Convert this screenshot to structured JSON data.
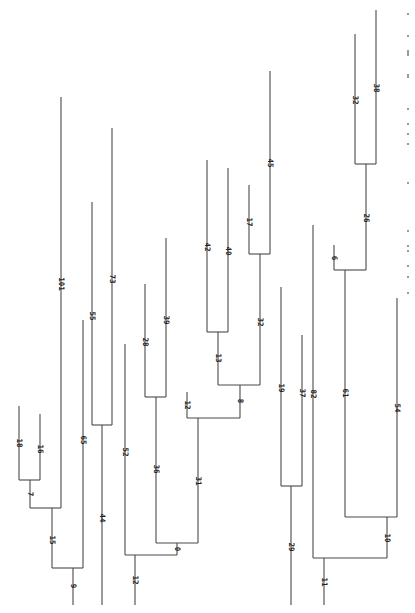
{
  "figure": {
    "type": "phylogenetic-tree",
    "orientation": "rotated-90",
    "line_color": "#4a4a4a",
    "label_color": "#222222",
    "background": "#ffffff"
  },
  "segments": [
    {
      "id": "b18",
      "x1": 19,
      "y1": 406,
      "x2": 19,
      "y2": 480
    },
    {
      "id": "b16",
      "x1": 40,
      "y1": 414,
      "x2": 40,
      "y2": 480
    },
    {
      "id": "h18_16",
      "x1": 19,
      "y1": 480,
      "x2": 40,
      "y2": 480
    },
    {
      "id": "b7",
      "x1": 30,
      "y1": 480,
      "x2": 30,
      "y2": 508
    },
    {
      "id": "b101",
      "x1": 61,
      "y1": 97,
      "x2": 61,
      "y2": 508
    },
    {
      "id": "h7_101",
      "x1": 30,
      "y1": 508,
      "x2": 61,
      "y2": 508
    },
    {
      "id": "b15",
      "x1": 52,
      "y1": 508,
      "x2": 52,
      "y2": 568
    },
    {
      "id": "b65",
      "x1": 83,
      "y1": 320,
      "x2": 83,
      "y2": 568
    },
    {
      "id": "h15_65",
      "x1": 52,
      "y1": 568,
      "x2": 83,
      "y2": 568
    },
    {
      "id": "b9",
      "x1": 73,
      "y1": 568,
      "x2": 73,
      "y2": 605
    },
    {
      "id": "b55",
      "x1": 92,
      "y1": 202,
      "x2": 92,
      "y2": 425
    },
    {
      "id": "b73",
      "x1": 112,
      "y1": 128,
      "x2": 112,
      "y2": 425
    },
    {
      "id": "h55_73",
      "x1": 92,
      "y1": 425,
      "x2": 112,
      "y2": 425
    },
    {
      "id": "b44",
      "x1": 102,
      "y1": 425,
      "x2": 102,
      "y2": 605
    },
    {
      "id": "b52",
      "x1": 125,
      "y1": 344,
      "x2": 125,
      "y2": 555
    },
    {
      "id": "b28",
      "x1": 145,
      "y1": 284,
      "x2": 145,
      "y2": 397
    },
    {
      "id": "b39",
      "x1": 166,
      "y1": 238,
      "x2": 166,
      "y2": 397
    },
    {
      "id": "h28_39",
      "x1": 145,
      "y1": 397,
      "x2": 166,
      "y2": 397
    },
    {
      "id": "b36",
      "x1": 156,
      "y1": 397,
      "x2": 156,
      "y2": 543
    },
    {
      "id": "b12a",
      "x1": 187,
      "y1": 392,
      "x2": 187,
      "y2": 418
    },
    {
      "id": "b42",
      "x1": 207,
      "y1": 160,
      "x2": 207,
      "y2": 332
    },
    {
      "id": "b40",
      "x1": 228,
      "y1": 168,
      "x2": 228,
      "y2": 332
    },
    {
      "id": "h42_40",
      "x1": 207,
      "y1": 332,
      "x2": 228,
      "y2": 332
    },
    {
      "id": "b13",
      "x1": 218,
      "y1": 332,
      "x2": 218,
      "y2": 385
    },
    {
      "id": "b17",
      "x1": 249,
      "y1": 185,
      "x2": 249,
      "y2": 254
    },
    {
      "id": "b45",
      "x1": 270,
      "y1": 71,
      "x2": 270,
      "y2": 254
    },
    {
      "id": "h17_45",
      "x1": 249,
      "y1": 254,
      "x2": 270,
      "y2": 254
    },
    {
      "id": "b32a",
      "x1": 260,
      "y1": 254,
      "x2": 260,
      "y2": 385
    },
    {
      "id": "h13_32",
      "x1": 218,
      "y1": 385,
      "x2": 260,
      "y2": 385
    },
    {
      "id": "b8",
      "x1": 240,
      "y1": 385,
      "x2": 240,
      "y2": 418
    },
    {
      "id": "h12_8",
      "x1": 187,
      "y1": 418,
      "x2": 240,
      "y2": 418
    },
    {
      "id": "b31",
      "x1": 198,
      "y1": 418,
      "x2": 198,
      "y2": 543
    },
    {
      "id": "h36_31",
      "x1": 156,
      "y1": 543,
      "x2": 198,
      "y2": 543
    },
    {
      "id": "b0",
      "x1": 177,
      "y1": 543,
      "x2": 177,
      "y2": 555
    },
    {
      "id": "h52_0",
      "x1": 125,
      "y1": 555,
      "x2": 177,
      "y2": 555
    },
    {
      "id": "b12b",
      "x1": 135,
      "y1": 555,
      "x2": 135,
      "y2": 605
    },
    {
      "id": "b19",
      "x1": 281,
      "y1": 287,
      "x2": 281,
      "y2": 486
    },
    {
      "id": "b37",
      "x1": 302,
      "y1": 335,
      "x2": 302,
      "y2": 486
    },
    {
      "id": "h19_37",
      "x1": 281,
      "y1": 486,
      "x2": 302,
      "y2": 486
    },
    {
      "id": "b29",
      "x1": 291,
      "y1": 486,
      "x2": 291,
      "y2": 605
    },
    {
      "id": "b82",
      "x1": 313,
      "y1": 225,
      "x2": 313,
      "y2": 558
    },
    {
      "id": "b32b",
      "x1": 355,
      "y1": 34,
      "x2": 355,
      "y2": 164
    },
    {
      "id": "b38",
      "x1": 376,
      "y1": 10,
      "x2": 376,
      "y2": 164
    },
    {
      "id": "h32_38",
      "x1": 355,
      "y1": 164,
      "x2": 376,
      "y2": 164
    },
    {
      "id": "b26",
      "x1": 366,
      "y1": 164,
      "x2": 366,
      "y2": 270
    },
    {
      "id": "b6",
      "x1": 334,
      "y1": 245,
      "x2": 334,
      "y2": 270
    },
    {
      "id": "h6_26",
      "x1": 334,
      "y1": 270,
      "x2": 366,
      "y2": 270
    },
    {
      "id": "b61",
      "x1": 345,
      "y1": 270,
      "x2": 345,
      "y2": 517
    },
    {
      "id": "b54",
      "x1": 397,
      "y1": 298,
      "x2": 397,
      "y2": 517
    },
    {
      "id": "h61_54",
      "x1": 345,
      "y1": 517,
      "x2": 397,
      "y2": 517
    },
    {
      "id": "b10",
      "x1": 387,
      "y1": 517,
      "x2": 387,
      "y2": 558
    },
    {
      "id": "h82_10",
      "x1": 313,
      "y1": 558,
      "x2": 387,
      "y2": 558
    },
    {
      "id": "b11",
      "x1": 324,
      "y1": 558,
      "x2": 324,
      "y2": 605
    }
  ],
  "labels": [
    {
      "text": "18",
      "x": 17,
      "y": 443
    },
    {
      "text": "16",
      "x": 38,
      "y": 449
    },
    {
      "text": "7",
      "x": 28,
      "y": 494
    },
    {
      "text": "15",
      "x": 50,
      "y": 540
    },
    {
      "text": "9",
      "x": 71,
      "y": 586
    },
    {
      "text": "101",
      "x": 59,
      "y": 284
    },
    {
      "text": "65",
      "x": 81,
      "y": 440
    },
    {
      "text": "55",
      "x": 90,
      "y": 316
    },
    {
      "text": "73",
      "x": 110,
      "y": 279
    },
    {
      "text": "44",
      "x": 100,
      "y": 518
    },
    {
      "text": "52",
      "x": 123,
      "y": 452
    },
    {
      "text": "28",
      "x": 143,
      "y": 342
    },
    {
      "text": "39",
      "x": 164,
      "y": 320
    },
    {
      "text": "36",
      "x": 154,
      "y": 469
    },
    {
      "text": "12",
      "x": 185,
      "y": 405
    },
    {
      "text": "31",
      "x": 196,
      "y": 481
    },
    {
      "text": "0",
      "x": 175,
      "y": 549
    },
    {
      "text": "12",
      "x": 133,
      "y": 580
    },
    {
      "text": "42",
      "x": 205,
      "y": 247
    },
    {
      "text": "40",
      "x": 226,
      "y": 251
    },
    {
      "text": "13",
      "x": 216,
      "y": 358
    },
    {
      "text": "17",
      "x": 247,
      "y": 222
    },
    {
      "text": "45",
      "x": 268,
      "y": 163
    },
    {
      "text": "32",
      "x": 258,
      "y": 322
    },
    {
      "text": "8",
      "x": 238,
      "y": 401
    },
    {
      "text": "19",
      "x": 279,
      "y": 388
    },
    {
      "text": "37",
      "x": 300,
      "y": 393
    },
    {
      "text": "29",
      "x": 289,
      "y": 547
    },
    {
      "text": "82",
      "x": 311,
      "y": 394
    },
    {
      "text": "6",
      "x": 332,
      "y": 258
    },
    {
      "text": "32",
      "x": 353,
      "y": 100
    },
    {
      "text": "38",
      "x": 374,
      "y": 88
    },
    {
      "text": "26",
      "x": 364,
      "y": 218
    },
    {
      "text": "61",
      "x": 343,
      "y": 393
    },
    {
      "text": "54",
      "x": 395,
      "y": 408
    },
    {
      "text": "10",
      "x": 385,
      "y": 538
    },
    {
      "text": "11",
      "x": 322,
      "y": 582
    }
  ],
  "caption": {
    "legible": false,
    "dot_positions": [
      13,
      35,
      50,
      52,
      54,
      74,
      76,
      108,
      123,
      133,
      143,
      182,
      230,
      245,
      250,
      265,
      276,
      292
    ]
  }
}
